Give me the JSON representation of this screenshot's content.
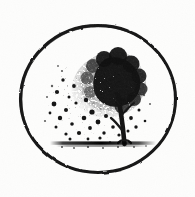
{
  "artwork": {
    "title": "Tree enclosed in a hand-drawn circle",
    "medium": "black ink stipple illustration on white paper",
    "style": "scanned line-art emblem / vignette",
    "caption": "Stippled deciduous tree inside a hand-drawn ink circle, canopy dissolving into scattered dots",
    "canvas": {
      "width": 195,
      "height": 197,
      "background_color": "#fdfdfc",
      "ink_color": "#111111"
    },
    "elements": [
      {
        "name": "circle-frame",
        "description": "hand-drawn uneven ink ring enclosing the scene",
        "center_x": 98,
        "center_y": 99,
        "radius_x": 78,
        "radius_y": 74,
        "stroke_width": 3.2,
        "color": "#141414"
      },
      {
        "name": "tree-canopy",
        "description": "dense stippled foliage mass, darkest at upper right",
        "center_x": 112,
        "center_y": 88,
        "radius_x": 36,
        "radius_y": 34,
        "top_y": 52,
        "right_x": 146,
        "density": "high",
        "color": "#101010"
      },
      {
        "name": "canopy-dissolve",
        "description": "sparse scattered dots spilling to the left and below the canopy",
        "region_x": 48,
        "region_y": 70,
        "region_width": 62,
        "region_height": 72,
        "density": "low",
        "color": "#1a1a1a"
      },
      {
        "name": "tree-trunk",
        "description": "slender curving trunk right of center rising into the canopy",
        "base_x": 124,
        "base_y": 143,
        "top_x": 118,
        "top_y": 96,
        "stroke_width": 4,
        "color": "#121212"
      },
      {
        "name": "ground-line",
        "description": "dark horizontal ground band beneath the tree",
        "start_x": 50,
        "end_x": 156,
        "y": 143,
        "thickness": 3.5,
        "color": "#161616"
      }
    ],
    "palette": {
      "paper": "#fdfdfc",
      "ink": "#111111",
      "ink_soft": "#4a4a4a",
      "ink_faint": "#8d8d8d"
    }
  }
}
